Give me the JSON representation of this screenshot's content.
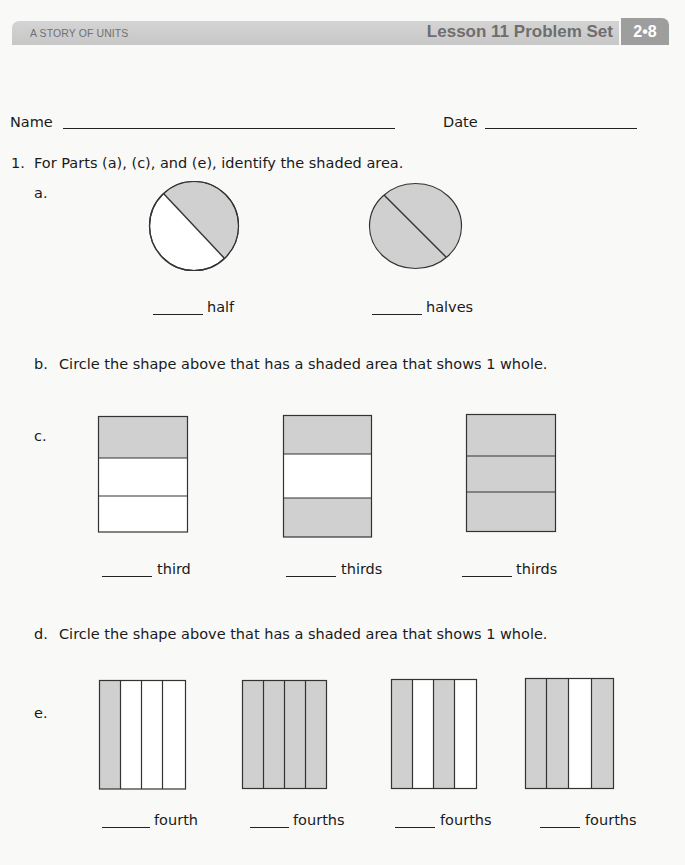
{
  "header": {
    "series": "A STORY OF UNITS",
    "lesson_title": "Lesson 11 Problem Set",
    "badge": "2•8"
  },
  "student": {
    "name_label": "Name",
    "name_value": "",
    "date_label": "Date",
    "date_value": ""
  },
  "problem1": {
    "number": "1.",
    "instruction": "For Parts (a), (c), and (e), identify the shaded area.",
    "part_a": {
      "label": "a.",
      "shapes": [
        {
          "type": "circle",
          "parts": 2,
          "shaded": 1,
          "answer": "",
          "unit_word": "half"
        },
        {
          "type": "circle",
          "parts": 2,
          "shaded": 2,
          "answer": "",
          "unit_word": "halves"
        }
      ]
    },
    "part_b": {
      "label": "b.",
      "instruction": "Circle the shape above that has a shaded area that shows 1 whole."
    },
    "part_c": {
      "label": "c.",
      "shapes": [
        {
          "type": "rect-horizontal",
          "parts": 3,
          "shaded_parts": [
            1
          ],
          "answer": "",
          "unit_word": "third"
        },
        {
          "type": "rect-horizontal",
          "parts": 3,
          "shaded_parts": [
            1,
            3
          ],
          "answer": "",
          "unit_word": "thirds"
        },
        {
          "type": "rect-horizontal",
          "parts": 3,
          "shaded_parts": [
            1,
            2,
            3
          ],
          "answer": "",
          "unit_word": "thirds"
        }
      ]
    },
    "part_d": {
      "label": "d.",
      "instruction": "Circle the shape above that has a shaded area that shows 1 whole."
    },
    "part_e": {
      "label": "e.",
      "shapes": [
        {
          "type": "rect-vertical",
          "parts": 4,
          "shaded_parts": [
            1
          ],
          "answer": "",
          "unit_word": "fourth"
        },
        {
          "type": "rect-vertical",
          "parts": 4,
          "shaded_parts": [
            1,
            2,
            3,
            4
          ],
          "answer": "",
          "unit_word": "fourths"
        },
        {
          "type": "rect-vertical",
          "parts": 4,
          "shaded_parts": [
            1,
            3
          ],
          "answer": "",
          "unit_word": "fourths"
        },
        {
          "type": "rect-vertical",
          "parts": 4,
          "shaded_parts": [
            1,
            2,
            4
          ],
          "answer": "",
          "unit_word": "fourths"
        }
      ]
    }
  },
  "colors": {
    "shade": "#d0d0d0",
    "stroke": "#333333",
    "header_bar": "#cccccc",
    "badge": "#9e9e9e"
  }
}
